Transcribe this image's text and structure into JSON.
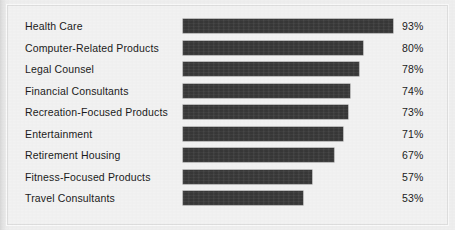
{
  "chart_data": {
    "type": "bar",
    "orientation": "horizontal",
    "title": "",
    "subtitle": "",
    "xlabel": "",
    "ylabel": "",
    "xlim": [
      0,
      100
    ],
    "grid": false,
    "legend": null,
    "value_suffix": "%",
    "categories": [
      "Health Care",
      "Computer-Related Products",
      "Legal Counsel",
      "Financial Consultants",
      "Recreation-Focused Products",
      "Entertainment",
      "Retirement Housing",
      "Fitness-Focused Products",
      "Travel Consultants"
    ],
    "values": [
      93,
      80,
      78,
      74,
      73,
      71,
      67,
      57,
      53
    ],
    "value_labels": [
      "93%",
      "80%",
      "78%",
      "74%",
      "73%",
      "71%",
      "67%",
      "57%",
      "53%"
    ],
    "bar_color": "#3b3b3b",
    "background_color": "#f2f2f2",
    "text_color": "#1b1b1b"
  },
  "rows": [
    {
      "label": "Health Care",
      "value": 93,
      "value_label": "93%"
    },
    {
      "label": "Computer-Related Products",
      "value": 80,
      "value_label": "80%"
    },
    {
      "label": "Legal Counsel",
      "value": 78,
      "value_label": "78%"
    },
    {
      "label": "Financial Consultants",
      "value": 74,
      "value_label": "74%"
    },
    {
      "label": "Recreation-Focused Products",
      "value": 73,
      "value_label": "73%"
    },
    {
      "label": "Entertainment",
      "value": 71,
      "value_label": "71%"
    },
    {
      "label": "Retirement Housing",
      "value": 67,
      "value_label": "67%"
    },
    {
      "label": "Fitness-Focused Products",
      "value": 57,
      "value_label": "57%"
    },
    {
      "label": "Travel Consultants",
      "value": 53,
      "value_label": "53%"
    }
  ],
  "layout": {
    "bar_origin_x": 183,
    "bar_px_per_percent": 2.255,
    "first_row_y": 16,
    "row_pitch": 21.5,
    "value_x": 402
  }
}
